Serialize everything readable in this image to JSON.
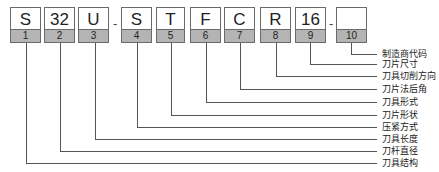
{
  "diagram": {
    "title": "",
    "boxes": [
      {
        "code": "S",
        "num": "1"
      },
      {
        "code": "32",
        "num": "2"
      },
      {
        "code": "U",
        "num": "3"
      },
      {
        "code": "S",
        "num": "4"
      },
      {
        "code": "T",
        "num": "5"
      },
      {
        "code": "F",
        "num": "6"
      },
      {
        "code": "C",
        "num": "7"
      },
      {
        "code": "R",
        "num": "8"
      },
      {
        "code": "16",
        "num": "9"
      },
      {
        "code": "",
        "num": "10"
      }
    ],
    "separators": [
      "-",
      "-"
    ],
    "labels": [
      "制造商代码",
      "刀片尺寸",
      "刀具切削方向",
      "刀片法后角",
      "刀具形式",
      "刀片形状",
      "压紧方式",
      "刀具长度",
      "刀杆直径",
      "刀具结构"
    ],
    "colors": {
      "number_row": "#b4b4b4",
      "border": "#6a6a6a",
      "line": "#555555"
    }
  }
}
